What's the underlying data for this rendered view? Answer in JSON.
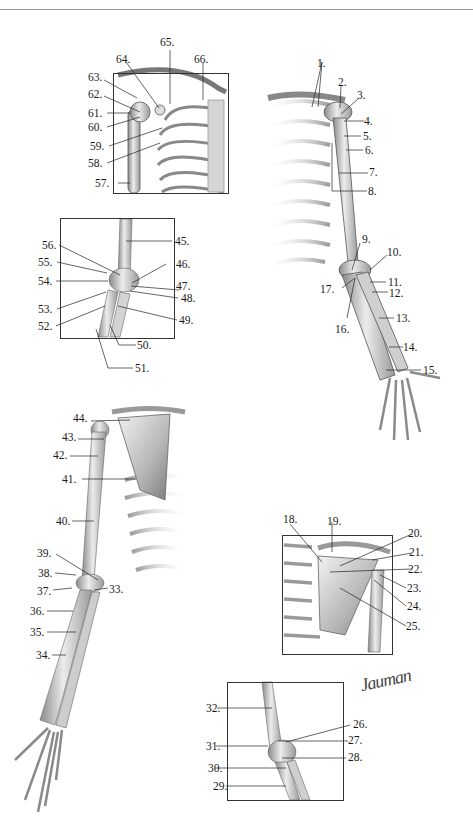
{
  "header": {
    "rule": "horizontal-divider"
  },
  "figures": [
    {
      "id": "shoulder-anterior-small",
      "description": "Anterior shoulder with rib cage (boxed)",
      "labels": [
        "57.",
        "58.",
        "59.",
        "60.",
        "61.",
        "62.",
        "63.",
        "64.",
        "65.",
        "66."
      ]
    },
    {
      "id": "arm-anterior-right",
      "description": "Full anterior right upper limb with thorax",
      "labels": [
        "1.",
        "2.",
        "3.",
        "4.",
        "5.",
        "6.",
        "7.",
        "8.",
        "9.",
        "10.",
        "11.",
        "12.",
        "13.",
        "14.",
        "15.",
        "16.",
        "17."
      ]
    },
    {
      "id": "elbow-anterior-boxed",
      "description": "Anterior elbow joint (boxed)",
      "labels": [
        "45.",
        "46.",
        "47.",
        "48.",
        "49.",
        "50.",
        "51.",
        "52.",
        "53.",
        "54.",
        "55.",
        "56."
      ]
    },
    {
      "id": "arm-posterior-left",
      "description": "Full posterior upper limb with scapula and ribs",
      "labels": [
        "33.",
        "34.",
        "35.",
        "36.",
        "37.",
        "38.",
        "39.",
        "40.",
        "41.",
        "42.",
        "43.",
        "44."
      ]
    },
    {
      "id": "scapula-posterior-boxed",
      "description": "Posterior shoulder / scapula (boxed)",
      "labels": [
        "18.",
        "19.",
        "20.",
        "21.",
        "22.",
        "23.",
        "24.",
        "25."
      ]
    },
    {
      "id": "elbow-posterior-boxed",
      "description": "Posterior elbow joint (boxed)",
      "labels": [
        "26.",
        "27.",
        "28.",
        "29.",
        "30.",
        "31.",
        "32."
      ]
    }
  ],
  "labels": {
    "l1": "1.",
    "l2": "2.",
    "l3": "3.",
    "l4": "4.",
    "l5": "5.",
    "l6": "6.",
    "l7": "7.",
    "l8": "8.",
    "l9": "9.",
    "l10": "10.",
    "l11": "11.",
    "l12": "12.",
    "l13": "13.",
    "l14": "14.",
    "l15": "15.",
    "l16": "16.",
    "l17": "17.",
    "l18": "18.",
    "l19": "19.",
    "l20": "20.",
    "l21": "21.",
    "l22": "22.",
    "l23": "23.",
    "l24": "24.",
    "l25": "25.",
    "l26": "26.",
    "l27": "27.",
    "l28": "28.",
    "l29": "29.",
    "l30": "30.",
    "l31": "31.",
    "l32": "32.",
    "l33": "33.",
    "l34": "34.",
    "l35": "35.",
    "l36": "36.",
    "l37": "37.",
    "l38": "38.",
    "l39": "39.",
    "l40": "40.",
    "l41": "41.",
    "l42": "42.",
    "l43": "43.",
    "l44": "44.",
    "l45": "45.",
    "l46": "46.",
    "l47": "47.",
    "l48": "48.",
    "l49": "49.",
    "l50": "50.",
    "l51": "51.",
    "l52": "52.",
    "l53": "53.",
    "l54": "54.",
    "l55": "55.",
    "l56": "56.",
    "l57": "57.",
    "l58": "58.",
    "l59": "59.",
    "l60": "60.",
    "l61": "61.",
    "l62": "62.",
    "l63": "63.",
    "l64": "64.",
    "l65": "65.",
    "l66": "66."
  },
  "signature": "Jauman",
  "colors": {
    "bone_light": "#e6e6e6",
    "bone_mid": "#b8b8b8",
    "bone_dark": "#6f6f6f",
    "line": "#222222",
    "frame": "#333333"
  }
}
